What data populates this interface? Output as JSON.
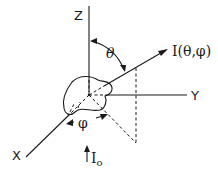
{
  "diagram": {
    "axes": {
      "z_label": "Z",
      "y_label": "Y",
      "x_label": "X"
    },
    "angles": {
      "polar": "θ",
      "azimuthal": "φ"
    },
    "scattered_intensity_label": "I(θ,φ)",
    "incident_intensity_label": "I",
    "incident_intensity_subscript": "o"
  }
}
